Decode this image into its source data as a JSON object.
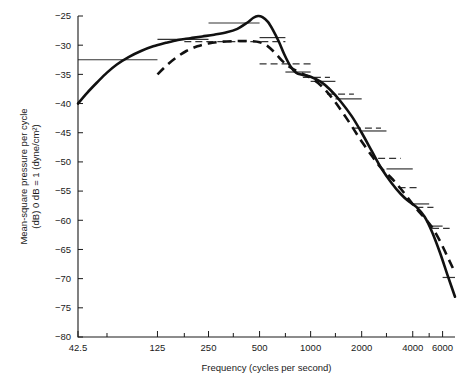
{
  "chart_data": {
    "type": "line",
    "title": "",
    "xlabel": "Frequency (cycles per second)",
    "ylabel_line1": "Mean-square pressure per cycle",
    "ylabel_line2": "(dB) 0 dB = 1 (dyne/cm²)",
    "x_scale": "log",
    "xlim": [
      42.5,
      7100
    ],
    "ylim": [
      -80,
      -25
    ],
    "grid": false,
    "legend": "none",
    "xticks": [
      42.5,
      125,
      250,
      500,
      1000,
      2000,
      4000,
      6000
    ],
    "xtick_labels": [
      "42.5",
      "125",
      "250",
      "500",
      "1000",
      "2000",
      "4000",
      "6000"
    ],
    "xminor_ticks": [
      63,
      180,
      350,
      710,
      1400,
      2800,
      5000
    ],
    "yticks": [
      -25,
      -30,
      -35,
      -40,
      -45,
      -50,
      -55,
      -60,
      -65,
      -70,
      -75,
      -80
    ],
    "ytick_labels": [
      "−25",
      "−30",
      "−35",
      "−40",
      "−45",
      "−50",
      "−55",
      "−60",
      "−65",
      "−70",
      "−75",
      "−80"
    ],
    "series": [
      {
        "name": "solid-curve",
        "style": "solid",
        "points": [
          [
            42.5,
            -40.0
          ],
          [
            48,
            -38.2
          ],
          [
            55,
            -36.4
          ],
          [
            63,
            -34.7
          ],
          [
            72,
            -33.3
          ],
          [
            85,
            -32.0
          ],
          [
            100,
            -31.0
          ],
          [
            118,
            -30.2
          ],
          [
            140,
            -29.6
          ],
          [
            165,
            -29.1
          ],
          [
            195,
            -28.8
          ],
          [
            230,
            -28.5
          ],
          [
            270,
            -28.2
          ],
          [
            320,
            -27.8
          ],
          [
            370,
            -27.2
          ],
          [
            420,
            -26.2
          ],
          [
            460,
            -25.3
          ],
          [
            490,
            -25.0
          ],
          [
            520,
            -25.2
          ],
          [
            560,
            -26.0
          ],
          [
            600,
            -27.4
          ],
          [
            650,
            -29.4
          ],
          [
            700,
            -31.6
          ],
          [
            760,
            -33.6
          ],
          [
            820,
            -34.7
          ],
          [
            900,
            -35.1
          ],
          [
            1000,
            -35.4
          ],
          [
            1150,
            -36.3
          ],
          [
            1300,
            -37.6
          ],
          [
            1500,
            -39.6
          ],
          [
            1750,
            -42.2
          ],
          [
            2000,
            -45.0
          ],
          [
            2300,
            -48.2
          ],
          [
            2600,
            -51.0
          ],
          [
            3000,
            -53.6
          ],
          [
            3400,
            -55.5
          ],
          [
            3800,
            -56.8
          ],
          [
            4200,
            -57.7
          ],
          [
            4700,
            -59.4
          ],
          [
            5200,
            -62.0
          ],
          [
            5800,
            -65.6
          ],
          [
            6400,
            -69.3
          ],
          [
            7100,
            -73.1
          ]
        ]
      },
      {
        "name": "dashed-curve",
        "style": "dashed",
        "points": [
          [
            125,
            -35.0
          ],
          [
            140,
            -33.6
          ],
          [
            160,
            -32.2
          ],
          [
            185,
            -31.0
          ],
          [
            215,
            -30.2
          ],
          [
            250,
            -29.7
          ],
          [
            300,
            -29.4
          ],
          [
            360,
            -29.3
          ],
          [
            430,
            -29.3
          ],
          [
            500,
            -29.5
          ],
          [
            560,
            -30.2
          ],
          [
            620,
            -31.4
          ],
          [
            680,
            -32.7
          ],
          [
            740,
            -33.6
          ],
          [
            800,
            -34.2
          ],
          [
            880,
            -34.8
          ],
          [
            1000,
            -35.6
          ],
          [
            1150,
            -36.9
          ],
          [
            1300,
            -38.6
          ],
          [
            1500,
            -41.0
          ],
          [
            1750,
            -43.9
          ],
          [
            2000,
            -46.5
          ],
          [
            2300,
            -49.0
          ],
          [
            2600,
            -51.0
          ],
          [
            3000,
            -52.8
          ],
          [
            3400,
            -54.6
          ],
          [
            3800,
            -56.4
          ],
          [
            4200,
            -58.0
          ],
          [
            4700,
            -59.6
          ],
          [
            5200,
            -61.2
          ],
          [
            5800,
            -63.6
          ],
          [
            6400,
            -66.2
          ],
          [
            6900,
            -68.2
          ]
        ]
      }
    ],
    "bands_solid": [
      {
        "f_low": 42.5,
        "f_high": 125,
        "value": -32.5
      },
      {
        "f_low": 125,
        "f_high": 250,
        "value": -29.0
      },
      {
        "f_low": 250,
        "f_high": 500,
        "value": -26.2
      },
      {
        "f_low": 500,
        "f_high": 710,
        "value": -28.7
      },
      {
        "f_low": 710,
        "f_high": 1000,
        "value": -34.6
      },
      {
        "f_low": 1000,
        "f_high": 1400,
        "value": -36.2
      },
      {
        "f_low": 1400,
        "f_high": 2000,
        "value": -39.2
      },
      {
        "f_low": 2000,
        "f_high": 2800,
        "value": -44.7
      },
      {
        "f_low": 2800,
        "f_high": 4000,
        "value": -51.2
      },
      {
        "f_low": 4000,
        "f_high": 5000,
        "value": -57.2
      },
      {
        "f_low": 5000,
        "f_high": 6000,
        "value": -61.0
      },
      {
        "f_low": 6000,
        "f_high": 7100,
        "value": -69.8
      }
    ],
    "bands_dashed": [
      {
        "f_low": 180,
        "f_high": 710,
        "value": -29.4
      },
      {
        "f_low": 500,
        "f_high": 1000,
        "value": -33.2
      },
      {
        "f_low": 900,
        "f_high": 1300,
        "value": -35.5
      },
      {
        "f_low": 1250,
        "f_high": 1800,
        "value": -38.4
      },
      {
        "f_low": 1800,
        "f_high": 2600,
        "value": -44.2
      },
      {
        "f_low": 2500,
        "f_high": 3400,
        "value": -49.4
      },
      {
        "f_low": 3300,
        "f_high": 4300,
        "value": -54.4
      },
      {
        "f_low": 4200,
        "f_high": 5300,
        "value": -57.8
      },
      {
        "f_low": 5200,
        "f_high": 6600,
        "value": -61.4
      }
    ]
  }
}
